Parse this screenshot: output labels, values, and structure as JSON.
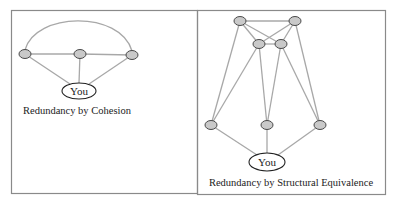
{
  "figure": {
    "panels": [
      {
        "id": "cohesion",
        "caption": "Redundancy by Cohesion",
        "ego_label": "You",
        "nodes": [
          {
            "id": "L",
            "x": 25,
            "y": 54
          },
          {
            "id": "M",
            "x": 80,
            "y": 54
          },
          {
            "id": "R",
            "x": 132,
            "y": 55
          }
        ],
        "ego": {
          "x": 79,
          "y": 91
        },
        "edges": [
          [
            "L",
            "M"
          ],
          [
            "M",
            "R"
          ],
          [
            "L",
            "You"
          ],
          [
            "M",
            "You"
          ],
          [
            "R",
            "You"
          ],
          [
            "L",
            "R",
            "arc"
          ]
        ]
      },
      {
        "id": "structural-equivalence",
        "caption": "Redundancy by Structural Equivalence",
        "ego_label": "You",
        "nodes": [
          {
            "id": "TL",
            "x": 240,
            "y": 21
          },
          {
            "id": "TR",
            "x": 295,
            "y": 21
          },
          {
            "id": "IL",
            "x": 259,
            "y": 44
          },
          {
            "id": "IR",
            "x": 281,
            "y": 44
          },
          {
            "id": "BL",
            "x": 211,
            "y": 125
          },
          {
            "id": "BM",
            "x": 267,
            "y": 125
          },
          {
            "id": "BR",
            "x": 320,
            "y": 125
          }
        ],
        "ego": {
          "x": 267,
          "y": 162
        },
        "edges": [
          [
            "TL",
            "TR"
          ],
          [
            "TL",
            "IL"
          ],
          [
            "TL",
            "IR"
          ],
          [
            "TR",
            "IL"
          ],
          [
            "TR",
            "IR"
          ],
          [
            "IL",
            "IR"
          ],
          [
            "TL",
            "BL"
          ],
          [
            "TR",
            "BR"
          ],
          [
            "IL",
            "BL"
          ],
          [
            "IL",
            "BM"
          ],
          [
            "IR",
            "BM"
          ],
          [
            "IR",
            "BR"
          ],
          [
            "BL",
            "You"
          ],
          [
            "BM",
            "You"
          ],
          [
            "BR",
            "You"
          ]
        ]
      }
    ],
    "colors": {
      "node_fill": "#c9c9c9",
      "node_stroke": "#4a4a4a",
      "edge": "#a8a8a8",
      "frame": "#8a8a8a"
    }
  }
}
